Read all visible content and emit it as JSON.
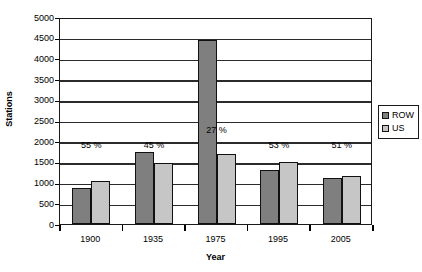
{
  "chart_data": {
    "type": "bar",
    "title": "",
    "xlabel": "Year",
    "ylabel": "Stations",
    "categories": [
      "1900",
      "1935",
      "1975",
      "1995",
      "2005"
    ],
    "series": [
      {
        "name": "ROW",
        "color": "#7f7f7f",
        "values": [
          870,
          1740,
          4440,
          1300,
          1110
        ]
      },
      {
        "name": "US",
        "color": "#c6c6c6",
        "values": [
          1040,
          1470,
          1680,
          1500,
          1160
        ]
      }
    ],
    "ylim": [
      0,
      5000
    ],
    "y_ticks": [
      0,
      500,
      1000,
      1500,
      2000,
      2500,
      3000,
      3500,
      4000,
      4500,
      5000
    ],
    "y_tick_labels": [
      "0",
      "500",
      "1000",
      "1500",
      "2000",
      "2500",
      "3000",
      "3500",
      "4000",
      "4500",
      "5000"
    ],
    "grid": true,
    "legend_position": "right",
    "annotations": [
      {
        "text": "55 %",
        "category": "1900",
        "value": 1950
      },
      {
        "text": "45 %",
        "category": "1935",
        "value": 1950
      },
      {
        "text": "27 %",
        "category": "1975",
        "value": 2330
      },
      {
        "text": "53 %",
        "category": "1995",
        "value": 1950
      },
      {
        "text": "51 %",
        "category": "2005",
        "value": 1950
      }
    ]
  },
  "legend": {
    "items": [
      {
        "label": "ROW"
      },
      {
        "label": "US"
      }
    ]
  }
}
